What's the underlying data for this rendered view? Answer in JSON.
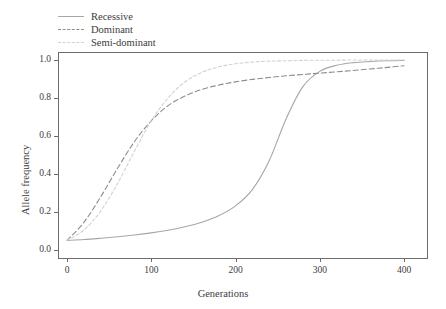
{
  "chart_data": {
    "type": "line",
    "title": "",
    "xlabel": "Generations",
    "ylabel": "Allele frequency",
    "xlim": [
      0,
      400
    ],
    "ylim": [
      0.0,
      1.0
    ],
    "xticks": [
      0,
      100,
      200,
      300,
      400
    ],
    "xtick_labels": [
      "0",
      "100",
      "200",
      "300",
      "400"
    ],
    "yticks": [
      0.0,
      0.2,
      0.4,
      0.6,
      0.8,
      1.0
    ],
    "ytick_labels": [
      "0.0",
      "0.2",
      "0.4",
      "0.6",
      "0.8",
      "1.0"
    ],
    "grid": false,
    "legend_position": "top-left",
    "x": [
      0,
      20,
      40,
      60,
      80,
      100,
      120,
      140,
      160,
      180,
      200,
      220,
      240,
      260,
      280,
      300,
      320,
      340,
      360,
      380,
      400
    ],
    "series": [
      {
        "name": "Recessive",
        "linestyle": "solid",
        "color": "#a6a6a6",
        "values": [
          0.05,
          0.055,
          0.062,
          0.07,
          0.079,
          0.09,
          0.104,
          0.122,
          0.146,
          0.18,
          0.232,
          0.318,
          0.47,
          0.69,
          0.86,
          0.94,
          0.972,
          0.986,
          0.992,
          0.996,
          0.998
        ]
      },
      {
        "name": "Dominant",
        "linestyle": "dashed",
        "color": "#8d8d8d",
        "values": [
          0.05,
          0.145,
          0.28,
          0.43,
          0.57,
          0.68,
          0.76,
          0.81,
          0.845,
          0.868,
          0.885,
          0.898,
          0.908,
          0.917,
          0.924,
          0.931,
          0.938,
          0.945,
          0.953,
          0.961,
          0.97
        ]
      },
      {
        "name": "Semi-dominant",
        "linestyle": "dotted",
        "color": "#d2d2d2",
        "values": [
          0.05,
          0.105,
          0.205,
          0.35,
          0.52,
          0.68,
          0.8,
          0.885,
          0.935,
          0.964,
          0.98,
          0.989,
          0.994,
          0.996,
          0.998,
          0.999,
          0.999,
          1.0,
          1.0,
          1.0,
          1.0
        ]
      }
    ],
    "legend": [
      {
        "label": "Recessive",
        "linestyle": "solid"
      },
      {
        "label": "Dominant",
        "linestyle": "dashed"
      },
      {
        "label": "Semi-dominant",
        "linestyle": "dotted"
      }
    ],
    "axes_color": "#6b6b6b",
    "background": "#ffffff"
  }
}
